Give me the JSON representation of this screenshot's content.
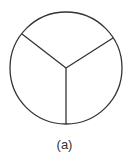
{
  "figure": {
    "caption": "(a)",
    "shape": "circle divided into three sectors",
    "stroke_color": "#333333"
  }
}
